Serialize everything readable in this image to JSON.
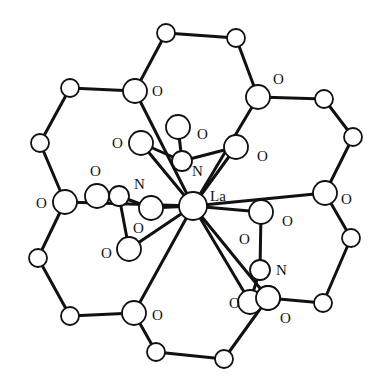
{
  "diagram": {
    "title": "",
    "central_atom": {
      "label": "La",
      "x": 193,
      "y": 206,
      "r": 14,
      "label_x": 210,
      "label_y": 201
    },
    "crown_atoms": [
      {
        "id": "C1",
        "el": "C",
        "x": 70,
        "y": 88,
        "r": 9
      },
      {
        "id": "O1",
        "el": "O",
        "x": 135,
        "y": 91,
        "r": 12,
        "label": "O",
        "label_x": 152,
        "label_y": 96
      },
      {
        "id": "C2",
        "el": "C",
        "x": 166,
        "y": 33,
        "r": 9
      },
      {
        "id": "C3",
        "el": "C",
        "x": 236,
        "y": 38,
        "r": 9
      },
      {
        "id": "O2",
        "el": "O",
        "x": 258,
        "y": 97,
        "r": 12,
        "label": "O",
        "label_x": 273,
        "label_y": 84
      },
      {
        "id": "C4",
        "el": "C",
        "x": 324,
        "y": 99,
        "r": 9
      },
      {
        "id": "C5",
        "el": "C",
        "x": 353,
        "y": 137,
        "r": 9
      },
      {
        "id": "O3",
        "el": "O",
        "x": 325,
        "y": 193,
        "r": 12,
        "label": "O",
        "label_x": 341,
        "label_y": 204
      },
      {
        "id": "C6",
        "el": "C",
        "x": 351,
        "y": 238,
        "r": 9
      },
      {
        "id": "C7",
        "el": "C",
        "x": 323,
        "y": 303,
        "r": 9
      },
      {
        "id": "O4",
        "el": "O",
        "x": 268,
        "y": 298,
        "r": 12,
        "label": "O",
        "label_x": 280,
        "label_y": 323
      },
      {
        "id": "C8",
        "el": "C",
        "x": 224,
        "y": 359,
        "r": 9
      },
      {
        "id": "C9",
        "el": "C",
        "x": 156,
        "y": 352,
        "r": 9
      },
      {
        "id": "O5",
        "el": "O",
        "x": 134,
        "y": 313,
        "r": 12,
        "label": "O",
        "label_x": 152,
        "label_y": 320
      },
      {
        "id": "C10",
        "el": "C",
        "x": 70,
        "y": 316,
        "r": 9
      },
      {
        "id": "C11",
        "el": "C",
        "x": 38,
        "y": 258,
        "r": 9
      },
      {
        "id": "O6",
        "el": "O",
        "x": 65,
        "y": 202,
        "r": 12,
        "label": "O",
        "label_x": 36,
        "label_y": 208
      },
      {
        "id": "C12",
        "el": "C",
        "x": 40,
        "y": 143,
        "r": 9
      }
    ],
    "crown_bonds": [
      [
        "C1",
        "O1"
      ],
      [
        "O1",
        "C2"
      ],
      [
        "C2",
        "C3"
      ],
      [
        "C3",
        "O2"
      ],
      [
        "O2",
        "C4"
      ],
      [
        "C4",
        "C5"
      ],
      [
        "C5",
        "O3"
      ],
      [
        "O3",
        "C6"
      ],
      [
        "C6",
        "C7"
      ],
      [
        "C7",
        "O4"
      ],
      [
        "O4",
        "C8"
      ],
      [
        "C8",
        "C9"
      ],
      [
        "C9",
        "O5"
      ],
      [
        "O5",
        "C10"
      ],
      [
        "C10",
        "C11"
      ],
      [
        "C11",
        "O6"
      ],
      [
        "O6",
        "C12"
      ],
      [
        "C12",
        "C1"
      ]
    ],
    "nitrate_atoms": [
      {
        "id": "N1",
        "el": "N",
        "x": 182,
        "y": 161,
        "r": 10,
        "label": "N",
        "label_x": 192,
        "label_y": 176
      },
      {
        "id": "N1a",
        "el": "O",
        "x": 141,
        "y": 143,
        "r": 12,
        "label": "O",
        "label_x": 112,
        "label_y": 148
      },
      {
        "id": "N1b",
        "el": "O",
        "x": 236,
        "y": 147,
        "r": 12,
        "label": "O",
        "label_x": 257,
        "label_y": 161
      },
      {
        "id": "N1c",
        "el": "O",
        "x": 178,
        "y": 127,
        "r": 12,
        "label": "O",
        "label_x": 197,
        "label_y": 139
      },
      {
        "id": "N2",
        "el": "N",
        "x": 119,
        "y": 196,
        "r": 10,
        "label": "N",
        "label_x": 134,
        "label_y": 189
      },
      {
        "id": "N2a",
        "el": "O",
        "x": 97,
        "y": 196,
        "r": 12,
        "label": "O",
        "label_x": 90,
        "label_y": 176
      },
      {
        "id": "N2b",
        "el": "O",
        "x": 151,
        "y": 208,
        "r": 12,
        "label": "O",
        "label_x": 133,
        "label_y": 233
      },
      {
        "id": "N2c",
        "el": "O",
        "x": 129,
        "y": 249,
        "r": 12,
        "label": "O",
        "label_x": 101,
        "label_y": 258
      },
      {
        "id": "N3",
        "el": "N",
        "x": 260,
        "y": 270,
        "r": 10,
        "label": "N",
        "label_x": 276,
        "label_y": 275
      },
      {
        "id": "N3a",
        "el": "O",
        "x": 261,
        "y": 212,
        "r": 12,
        "label": "O",
        "label_x": 282,
        "label_y": 226
      },
      {
        "id": "N3b",
        "el": "O",
        "x": 250,
        "y": 302,
        "r": 12,
        "label": "O",
        "label_x": 229,
        "label_y": 308
      },
      {
        "id": "N3c",
        "el": "O",
        "x": 268,
        "y": 298,
        "r": 12,
        "label": "O",
        "label_x": 239,
        "label_y": 244
      }
    ],
    "nitrate_bonds": [
      [
        "N1",
        "N1a"
      ],
      [
        "N1",
        "N1b"
      ],
      [
        "N1",
        "N1c"
      ],
      [
        "N2",
        "N2a"
      ],
      [
        "N2",
        "N2b"
      ],
      [
        "N2",
        "N2c"
      ],
      [
        "N3",
        "N3a"
      ],
      [
        "N3",
        "N3b"
      ]
    ],
    "la_bonds": [
      "O1",
      "O2",
      "O3",
      "O4",
      "O5",
      "O6",
      "N1a",
      "N1b",
      "N2b",
      "N2c",
      "N3a",
      "N3b"
    ],
    "colors": {
      "line": "#111111",
      "background": "#ffffff",
      "atom_fill": "#ffffff"
    }
  }
}
